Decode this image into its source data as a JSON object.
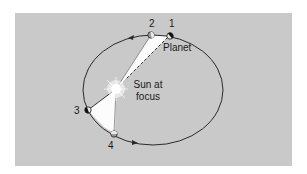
{
  "diagram": {
    "colors": {
      "panel": "#c9c9c9",
      "orbit": "#2a2a2a",
      "swept_area": "#ffffff",
      "planet_dark": "#111111",
      "planet_light": "#e8e8e8"
    },
    "labels": {
      "p1": "1",
      "p2": "2",
      "p3": "3",
      "p4": "4",
      "planet": "Planet",
      "sun_line1": "Sun at",
      "sun_line2": "focus"
    },
    "nodes": [
      {
        "id": "1",
        "name": "planet-position-1"
      },
      {
        "id": "2",
        "name": "planet-position-2"
      },
      {
        "id": "3",
        "name": "planet-position-3"
      },
      {
        "id": "4",
        "name": "planet-position-4"
      },
      {
        "id": "sun",
        "name": "sun"
      }
    ],
    "edges": [
      {
        "from": "sun",
        "to": "1",
        "style": "dashed"
      },
      {
        "from": "sun",
        "to": "2",
        "style": "solid"
      },
      {
        "from": "sun",
        "to": "3",
        "style": "solid"
      },
      {
        "from": "sun",
        "to": "4",
        "style": "solid"
      }
    ],
    "orbit_direction": "counterclockwise"
  }
}
